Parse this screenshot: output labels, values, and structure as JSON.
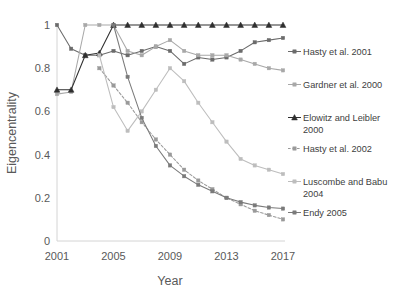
{
  "chart_data": {
    "type": "line",
    "title": "",
    "xlabel": "Year",
    "ylabel": "Eigencentrality",
    "xlim": [
      2001,
      2017
    ],
    "ylim": [
      0,
      1
    ],
    "grid": false,
    "legend_position": "right",
    "x": [
      2001,
      2002,
      2003,
      2004,
      2005,
      2006,
      2007,
      2008,
      2009,
      2010,
      2011,
      2012,
      2013,
      2014,
      2015,
      2016,
      2017
    ],
    "xticks": [
      "2001",
      "2005",
      "2009",
      "2013",
      "2017"
    ],
    "xtick_values": [
      2001,
      2005,
      2009,
      2013,
      2017
    ],
    "yticks": [
      "0",
      "0.2",
      "0.4",
      "0.6",
      "0.8",
      "1"
    ],
    "ytick_values": [
      0,
      0.2,
      0.4,
      0.6,
      0.8,
      1
    ],
    "series": [
      {
        "name": "Hasty et al. 2001",
        "color": "#6b6b6b",
        "style": "solid",
        "marker": "square",
        "values": [
          1.0,
          0.89,
          0.86,
          0.86,
          0.88,
          0.86,
          0.88,
          0.9,
          0.88,
          0.82,
          0.85,
          0.84,
          0.85,
          0.88,
          0.92,
          0.93,
          0.94
        ]
      },
      {
        "name": "Gardner et al. 2000",
        "color": "#a8a8a8",
        "style": "solid",
        "marker": "square",
        "values": [
          0.68,
          0.69,
          1.0,
          1.0,
          1.0,
          0.88,
          0.86,
          0.9,
          0.93,
          0.88,
          0.86,
          0.86,
          0.86,
          0.84,
          0.82,
          0.8,
          0.79
        ]
      },
      {
        "name": "Elowitz and Leibler 2000",
        "color": "#2f2f2f",
        "style": "solid",
        "marker": "triangle",
        "values": [
          0.7,
          0.7,
          0.86,
          0.87,
          1.0,
          1.0,
          1.0,
          1.0,
          1.0,
          1.0,
          1.0,
          1.0,
          1.0,
          1.0,
          1.0,
          1.0,
          1.0
        ]
      },
      {
        "name": "Hasty et al. 2002",
        "color": "#9a9a9a",
        "style": "dashed",
        "marker": "square",
        "values": [
          null,
          null,
          null,
          0.8,
          0.72,
          0.64,
          0.55,
          0.47,
          0.4,
          0.33,
          0.28,
          0.24,
          0.2,
          0.17,
          0.14,
          0.12,
          0.1
        ]
      },
      {
        "name": "Luscombe and Babu 2004",
        "color": "#bdbdbd",
        "style": "solid",
        "marker": "square",
        "values": [
          null,
          null,
          null,
          0.86,
          0.62,
          0.51,
          0.6,
          0.7,
          0.8,
          0.74,
          0.64,
          0.55,
          0.46,
          0.38,
          0.35,
          0.33,
          0.31
        ]
      },
      {
        "name": "Endy 2005",
        "color": "#7a7a7a",
        "style": "solid",
        "marker": "square",
        "values": [
          null,
          null,
          null,
          null,
          1.0,
          0.76,
          0.57,
          0.44,
          0.35,
          0.3,
          0.26,
          0.23,
          0.2,
          0.18,
          0.165,
          0.155,
          0.15
        ]
      }
    ],
    "extra_series_note": ""
  },
  "legend": {
    "items": [
      {
        "label": "Hasty et al. 2001"
      },
      {
        "label": "Gardner et al. 2000"
      },
      {
        "label": "Elowitz and Leibler"
      },
      {
        "label": "2000"
      },
      {
        "label": "Hasty et al. 2002"
      },
      {
        "label": "Luscombe and Babu"
      },
      {
        "label": "2004"
      },
      {
        "label": "Endy 2005"
      }
    ]
  },
  "axes": {
    "ylabel": "Eigencentrality",
    "xlabel": "Year"
  }
}
